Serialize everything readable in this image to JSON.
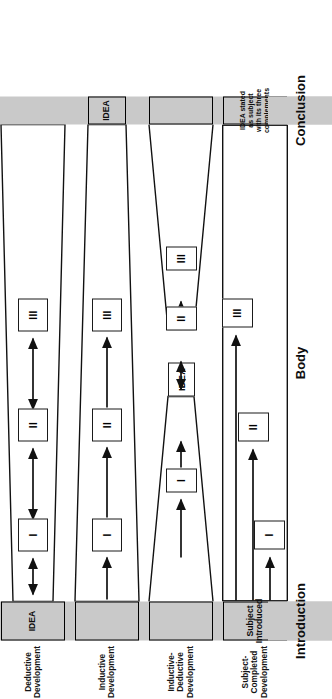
{
  "figure": {
    "orientation": "rotated-90-ccw",
    "colors": {
      "band_gray": "#c9c9c9",
      "outline": "#111111",
      "page": "#ffffff"
    }
  },
  "sections": {
    "introduction": "Introduction",
    "body": "Body",
    "conclusion": "Conclusion"
  },
  "rows": [
    {
      "id": "deductive",
      "title": "Deductive Development",
      "intro_label": "IDEA",
      "conclusion_label": "",
      "shape": "narrowing-wedge-left-to-right",
      "boxes": [
        "I",
        "II",
        "III"
      ],
      "arrows": "double-headed"
    },
    {
      "id": "inductive",
      "title": "Inductive Development",
      "intro_label": "",
      "conclusion_label": "IDEA",
      "shape": "widening-wedge-left-to-right",
      "boxes": [
        "I",
        "II",
        "III"
      ],
      "arrows": "single-headed-forward"
    },
    {
      "id": "inductive-deductive",
      "title": "Inductive-Deductive Development",
      "intro_label": "",
      "conclusion_label": "",
      "center_label": "IDEA",
      "shape": "hourglass",
      "boxes": [
        "I",
        "II",
        "III"
      ],
      "arrows": "mixed"
    },
    {
      "id": "subject-completed",
      "title": "Subject-Completed Development",
      "intro_label": "Subject Introduced",
      "conclusion_label": "IDEA stated as subject with its three complements",
      "shape": "open-rectangle",
      "boxes": [
        "I",
        "II",
        "III"
      ],
      "arrows": "staggered-forward"
    }
  ]
}
